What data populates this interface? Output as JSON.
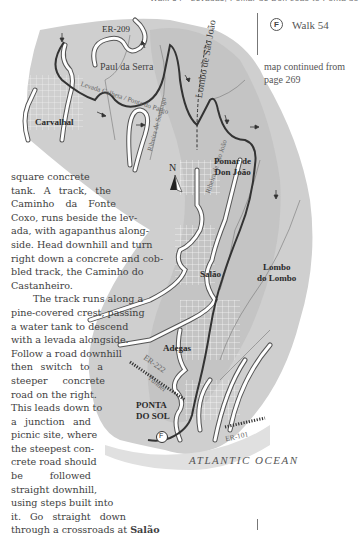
{
  "page": {
    "running_header": "Walk 54 · Levadas, Pomar de Don João to Ponta do Sol",
    "walk_label": "Walk 54",
    "walk_marker": "F",
    "map_continued_note": "map continued from page 269"
  },
  "body_text": {
    "lines": [
      "square concrete",
      "tank. A track, the",
      "Caminho da Fonte",
      "Coxo, runs beside the lev-",
      "ada, with agapanthus along-",
      "side. Head downhill and turn",
      "right down a concrete and cob-",
      "bled track, the Caminho do",
      "Castanheiro.",
      "The track runs along a",
      "pine-covered crest, passing",
      "a water tank to descend",
      "with a levada alongside.",
      "Follow a road downhill",
      "then switch to a",
      "steeper concrete",
      "road on the right.",
      "This leads down to",
      "a junction and",
      "picnic site, where",
      "the steepest con-",
      "crete road should",
      "be followed",
      "straight downhill,",
      "using steps built into",
      "it. Go straight down"
    ],
    "last_line_prefix": "through a crossroads at ",
    "last_line_bold": "Salão"
  },
  "map": {
    "labels": {
      "er209": "ER-209",
      "paul_da_serra": "Paul da Serra",
      "levada_calheta": "Levada Calheta / Ponta do Pargo",
      "carvalhal": "Carvalhal",
      "ribeira_santiago": "Ribeira de Santiago",
      "lombo_sao_joao": "Lombo de São João",
      "ribeira_sao_joao": "Ribeira de São João",
      "pomar_line1": "Pomar de",
      "pomar_line2": "Don João",
      "north": "N",
      "salao": "Salão",
      "lombo_line1": "Lombo",
      "lombo_line2": "do Lombo",
      "adegas": "Adegas",
      "er222": "ER-222",
      "tunnel": "Tunnel",
      "ponta_line1": "PONTA",
      "ponta_line2": "DO SOL",
      "er101": "ER-101",
      "finish_marker": "F",
      "ocean": "ATLANTIC OCEAN"
    }
  }
}
